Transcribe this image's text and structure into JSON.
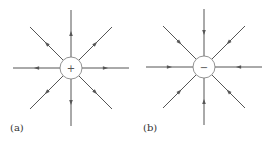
{
  "figure": {
    "line_color": "#555555",
    "panels": [
      {
        "label": "(a)",
        "charge_sign": "+",
        "field_direction": "outward",
        "cx": 71,
        "cy": 68,
        "r": 11,
        "line_length": 58,
        "num_lines": 8
      },
      {
        "label": "(b)",
        "charge_sign": "−",
        "field_direction": "inward",
        "cx": 204,
        "cy": 67,
        "r": 11,
        "line_length": 58,
        "num_lines": 8
      }
    ]
  }
}
